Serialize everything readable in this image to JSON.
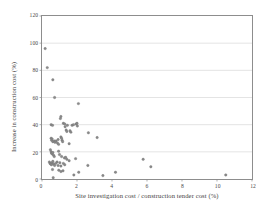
{
  "chart_data": {
    "type": "scatter",
    "title": "",
    "xlabel": "Site investigation cost / construction tender cost (%)",
    "ylabel": "Increase in construction cost (%)",
    "xlim": [
      0,
      12
    ],
    "ylim": [
      0,
      120
    ],
    "xticks": [
      0,
      2,
      4,
      6,
      8,
      10,
      12
    ],
    "yticks": [
      0,
      20,
      40,
      60,
      80,
      100,
      120
    ],
    "xtick_labels": [
      "0",
      "2",
      "4",
      "6",
      "8",
      "10",
      "12"
    ],
    "ytick_labels": [
      "0",
      "20",
      "40",
      "60",
      "80",
      "100",
      "120"
    ],
    "grid": "horizontal",
    "legend": "none",
    "marker_color": "#8a8a8a",
    "frame_color": "#8d8d8d",
    "gridline_color": "#d8d8d8",
    "series": [
      {
        "name": "projects",
        "points": [
          [
            0.18,
            96.0
          ],
          [
            0.3,
            82.0
          ],
          [
            0.62,
            73.0
          ],
          [
            0.72,
            60.0
          ],
          [
            1.05,
            44.5
          ],
          [
            1.08,
            46.0
          ],
          [
            2.08,
            55.5
          ],
          [
            1.22,
            41.0
          ],
          [
            1.3,
            40.5
          ],
          [
            1.32,
            38.5
          ],
          [
            1.45,
            39.5
          ],
          [
            1.72,
            39.5
          ],
          [
            1.8,
            40.0
          ],
          [
            1.95,
            40.5
          ],
          [
            2.0,
            41.0
          ],
          [
            2.02,
            39.0
          ],
          [
            0.52,
            40.0
          ],
          [
            0.6,
            39.5
          ],
          [
            1.38,
            36.0
          ],
          [
            1.42,
            35.0
          ],
          [
            1.6,
            35.5
          ],
          [
            1.65,
            34.5
          ],
          [
            2.65,
            34.0
          ],
          [
            3.15,
            30.5
          ],
          [
            0.52,
            30.0
          ],
          [
            0.55,
            28.5
          ],
          [
            0.58,
            29.5
          ],
          [
            0.62,
            27.5
          ],
          [
            0.7,
            28.0
          ],
          [
            0.74,
            27.0
          ],
          [
            0.8,
            28.0
          ],
          [
            0.92,
            29.0
          ],
          [
            1.08,
            31.0
          ],
          [
            1.12,
            30.0
          ],
          [
            1.15,
            28.5
          ],
          [
            1.18,
            27.5
          ],
          [
            0.88,
            26.5
          ],
          [
            0.95,
            25.5
          ],
          [
            1.55,
            26.0
          ],
          [
            0.48,
            21.5
          ],
          [
            0.52,
            20.0
          ],
          [
            0.55,
            19.0
          ],
          [
            0.58,
            18.5
          ],
          [
            0.62,
            19.5
          ],
          [
            0.66,
            17.5
          ],
          [
            0.7,
            16.5
          ],
          [
            0.95,
            20.5
          ],
          [
            1.0,
            18.0
          ],
          [
            1.12,
            16.5
          ],
          [
            1.28,
            15.5
          ],
          [
            1.35,
            16.0
          ],
          [
            1.42,
            14.5
          ],
          [
            1.55,
            13.5
          ],
          [
            1.92,
            15.0
          ],
          [
            5.78,
            14.5
          ],
          [
            6.22,
            9.0
          ],
          [
            0.42,
            12.5
          ],
          [
            0.46,
            11.5
          ],
          [
            0.5,
            11.0
          ],
          [
            0.54,
            10.5
          ],
          [
            0.58,
            12.0
          ],
          [
            0.62,
            13.0
          ],
          [
            0.66,
            11.0
          ],
          [
            0.72,
            10.0
          ],
          [
            0.78,
            11.5
          ],
          [
            0.86,
            12.5
          ],
          [
            0.92,
            10.0
          ],
          [
            1.02,
            12.0
          ],
          [
            1.08,
            9.5
          ],
          [
            1.22,
            11.5
          ],
          [
            1.3,
            10.5
          ],
          [
            2.62,
            10.0
          ],
          [
            0.6,
            7.0
          ],
          [
            0.96,
            6.5
          ],
          [
            1.08,
            5.5
          ],
          [
            1.2,
            6.0
          ],
          [
            1.82,
            3.0
          ],
          [
            2.1,
            5.0
          ],
          [
            3.48,
            2.5
          ],
          [
            4.2,
            5.0
          ],
          [
            10.5,
            3.0
          ],
          [
            0.64,
            1.0
          ]
        ]
      }
    ]
  }
}
